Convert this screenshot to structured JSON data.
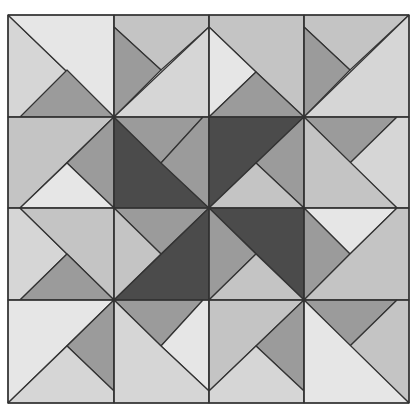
{
  "figure": {
    "grid": {
      "cols": [
        8,
        114,
        209,
        304,
        409
      ],
      "rows": [
        15,
        117,
        208,
        300,
        403
      ]
    },
    "colors": {
      "dark": "#4b4b4b",
      "medium": "#9b9b9b",
      "midlight": "#c4c4c4",
      "light": "#d6d6d6",
      "lightest": "#e6e6e6",
      "stroke": "#333333"
    },
    "polygons": [
      {
        "fill": "light",
        "points": "8,15 114,117 8,117"
      },
      {
        "fill": "lightest",
        "points": "8,15 114,15 114,117"
      },
      {
        "fill": "medium",
        "points": "20,117 114,117 67,70"
      },
      {
        "fill": "midlight",
        "points": "114,15 209,15 209,27 161,70 114,27"
      },
      {
        "fill": "medium",
        "points": "114,27 161,70 114,117"
      },
      {
        "fill": "light",
        "points": "114,117 209,27 209,117"
      },
      {
        "fill": "midlight",
        "points": "209,15 304,15 304,117 256,72 209,27"
      },
      {
        "fill": "lightest",
        "points": "209,27 256,72 209,117"
      },
      {
        "fill": "medium",
        "points": "209,117 256,72 304,117"
      },
      {
        "fill": "midlight",
        "points": "304,15 409,15 350,70 304,27"
      },
      {
        "fill": "medium",
        "points": "304,27 350,70 304,117"
      },
      {
        "fill": "light",
        "points": "304,117 409,15 409,117"
      },
      {
        "fill": "midlight",
        "points": "8,117 114,117 20,208 8,208"
      },
      {
        "fill": "medium",
        "points": "114,117 114,208 67,163"
      },
      {
        "fill": "lightest",
        "points": "20,208 67,163 114,208"
      },
      {
        "fill": "dark",
        "points": "114,117 209,208 114,208"
      },
      {
        "fill": "medium",
        "points": "114,117 203,117 161,163"
      },
      {
        "fill": "medium",
        "points": "203,117 209,117 209,208 161,163"
      },
      {
        "fill": "dark",
        "points": "209,117 304,117 209,208"
      },
      {
        "fill": "medium",
        "points": "304,117 304,208 256,163"
      },
      {
        "fill": "midlight",
        "points": "209,208 256,163 304,208"
      },
      {
        "fill": "medium",
        "points": "304,117 397,117 350,163"
      },
      {
        "fill": "light",
        "points": "397,117 409,117 409,208 397,208 350,163"
      },
      {
        "fill": "midlight",
        "points": "304,117 397,208 304,208"
      },
      {
        "fill": "light",
        "points": "8,208 20,208 67,254 20,300 8,300"
      },
      {
        "fill": "midlight",
        "points": "20,208 114,208 114,300"
      },
      {
        "fill": "medium",
        "points": "20,300 67,254 114,300"
      },
      {
        "fill": "medium",
        "points": "114,208 209,208 161,254"
      },
      {
        "fill": "midlight",
        "points": "114,208 161,254 114,300"
      },
      {
        "fill": "dark",
        "points": "209,208 209,300 114,300"
      },
      {
        "fill": "dark",
        "points": "209,208 304,208 304,300"
      },
      {
        "fill": "medium",
        "points": "209,208 256,254 209,300"
      },
      {
        "fill": "midlight",
        "points": "209,300 256,254 304,300"
      },
      {
        "fill": "lightest",
        "points": "304,208 397,208 350,254"
      },
      {
        "fill": "medium",
        "points": "304,208 350,254 304,300"
      },
      {
        "fill": "midlight",
        "points": "397,208 409,208 409,300 304,300 350,254"
      },
      {
        "fill": "lightest",
        "points": "8,300 114,300 8,403"
      },
      {
        "fill": "medium",
        "points": "114,300 114,391 67,346"
      },
      {
        "fill": "light",
        "points": "8,403 67,346 114,391 114,403"
      },
      {
        "fill": "medium",
        "points": "114,300 203,300 161,346"
      },
      {
        "fill": "lightest",
        "points": "203,300 209,300 209,391 161,346"
      },
      {
        "fill": "light",
        "points": "114,300 161,346 209,391 209,403 114,403"
      },
      {
        "fill": "midlight",
        "points": "209,300 304,300 209,391"
      },
      {
        "fill": "medium",
        "points": "304,300 304,391 256,346"
      },
      {
        "fill": "light",
        "points": "209,391 256,346 304,391 304,403 209,403"
      },
      {
        "fill": "medium",
        "points": "304,300 397,300 350,346"
      },
      {
        "fill": "midlight",
        "points": "397,300 409,300 409,403 350,346"
      },
      {
        "fill": "lightest",
        "points": "304,300 409,403 304,403"
      }
    ]
  }
}
